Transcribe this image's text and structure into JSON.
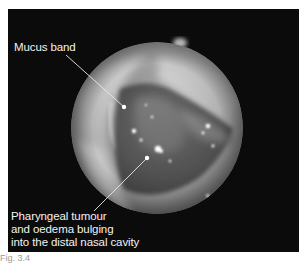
{
  "figure": {
    "type": "endoscopic-photograph",
    "annotations": [
      {
        "id": "mucus-band",
        "lines": [
          "Mucus band"
        ]
      },
      {
        "id": "pharyngeal-tumour",
        "lines": [
          "Pharyngeal tumour",
          "and oedema bulging",
          "into the distal nasal cavity"
        ]
      }
    ],
    "caption": "Fig. 3.4",
    "colors": {
      "background": "#0b0b0b",
      "label_text": "#f2f2f2",
      "leader_line": "#e8e8e8"
    }
  }
}
